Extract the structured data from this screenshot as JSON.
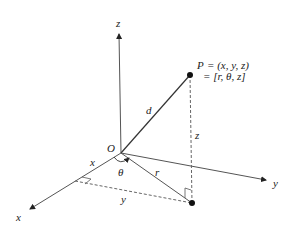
{
  "diagram": {
    "axes": {
      "x_label": "x",
      "y_label": "y",
      "z_label": "z"
    },
    "origin_label": "O",
    "point": {
      "name": "P",
      "cartesian_line": "= (x, y, z)",
      "cylindrical_line": "= [r, θ, z]"
    },
    "segment_labels": {
      "d": "d",
      "r": "r",
      "z": "z",
      "x": "x",
      "y": "y",
      "theta": "θ"
    },
    "colors": {
      "line": "#444444",
      "point": "#111111",
      "dashed": "#666666"
    }
  }
}
